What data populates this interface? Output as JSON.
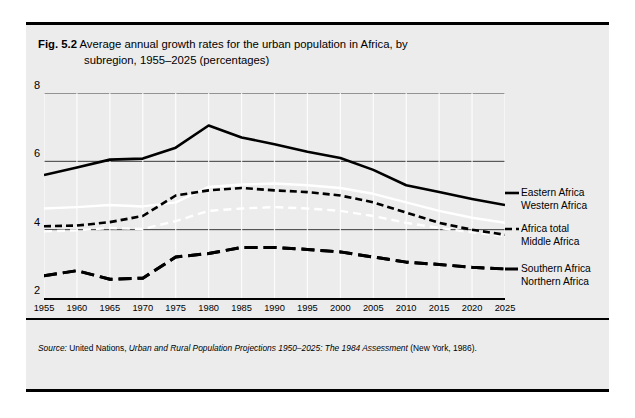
{
  "figure": {
    "number": "Fig. 5.2",
    "title_line1": "Average annual growth rates for the urban population in Africa, by",
    "title_line2": "subregion, 1955–2025 (percentages)"
  },
  "source": {
    "prefix": "Source:",
    "publisher": "United Nations,",
    "work": "Urban and Rural Population Projections 1950–2025: The 1984 Assessment",
    "place_year": "(New York, 1986)."
  },
  "legend": [
    {
      "key": "eastern",
      "label": "Eastern Africa",
      "style": "solid-black",
      "color": "#000000"
    },
    {
      "key": "western",
      "label": "Western Africa",
      "style": "dash-black",
      "color": "#000000"
    },
    {
      "key": "total",
      "label": "Africa total",
      "style": "solid-white",
      "color": "#ffffff"
    },
    {
      "key": "middle",
      "label": "Middle Africa",
      "style": "dash-white",
      "color": "#ffffff"
    },
    {
      "key": "southern",
      "label": "Southern Africa",
      "style": "longdash-black",
      "color": "#000000"
    },
    {
      "key": "northern",
      "label": "Northern Africa",
      "style": "longdash-black",
      "color": "#000000"
    }
  ],
  "chart_data": {
    "type": "line",
    "title": "Average annual growth rates for the urban population in Africa, by subregion, 1955–2025 (percentages)",
    "xlabel": "",
    "ylabel": "",
    "xlim": [
      1955,
      2025
    ],
    "ylim": [
      2,
      8
    ],
    "grid": true,
    "legend_position": "right",
    "x": [
      1955,
      1960,
      1965,
      1970,
      1975,
      1980,
      1985,
      1990,
      1995,
      2000,
      2005,
      2010,
      2015,
      2020,
      2025
    ],
    "xticklabels": [
      "1955",
      "1960",
      "1965",
      "1970",
      "1975",
      "1980",
      "1985",
      "1990",
      "1995",
      "2000",
      "2005",
      "2010",
      "2015",
      "2020",
      "2025"
    ],
    "yticks": [
      2,
      4,
      6,
      8
    ],
    "yticklabels": [
      "2",
      "4",
      "6",
      "8"
    ],
    "series": [
      {
        "name": "Eastern Africa",
        "style": "solid-black",
        "color": "#000000",
        "values": [
          5.6,
          5.82,
          6.05,
          6.08,
          6.4,
          7.05,
          6.7,
          6.5,
          6.28,
          6.1,
          5.75,
          5.3,
          5.1,
          4.9,
          4.72
        ]
      },
      {
        "name": "Western Africa",
        "style": "dash-black",
        "color": "#000000",
        "values": [
          4.1,
          4.12,
          4.22,
          4.4,
          5.0,
          5.15,
          5.22,
          5.15,
          5.1,
          5.0,
          4.8,
          4.5,
          4.2,
          4.0,
          3.85
        ]
      },
      {
        "name": "Africa total",
        "style": "solid-white",
        "color": "#ffffff",
        "values": [
          4.62,
          4.66,
          4.72,
          4.68,
          4.8,
          5.25,
          5.32,
          5.35,
          5.3,
          5.22,
          5.05,
          4.8,
          4.55,
          4.35,
          4.2
        ]
      },
      {
        "name": "Middle Africa",
        "style": "dash-white",
        "color": "#ffffff",
        "values": [
          3.95,
          3.98,
          4.05,
          4.02,
          4.25,
          4.55,
          4.62,
          4.66,
          4.62,
          4.55,
          4.4,
          4.2,
          4.05,
          3.92,
          3.82
        ]
      },
      {
        "name": "Southern Africa",
        "style": "longdash-black",
        "color": "#000000",
        "values": [
          2.65,
          2.8,
          2.55,
          2.58,
          3.2,
          3.3,
          3.48,
          3.48,
          3.42,
          3.35,
          3.2,
          3.05,
          2.98,
          2.9,
          2.85
        ]
      },
      {
        "name": "Northern Africa",
        "style": "longdash-black",
        "color": "#000000",
        "values": [
          2.65,
          2.8,
          2.55,
          2.58,
          3.2,
          3.3,
          3.48,
          3.48,
          3.42,
          3.35,
          3.2,
          3.05,
          2.98,
          2.9,
          2.85
        ]
      }
    ]
  }
}
